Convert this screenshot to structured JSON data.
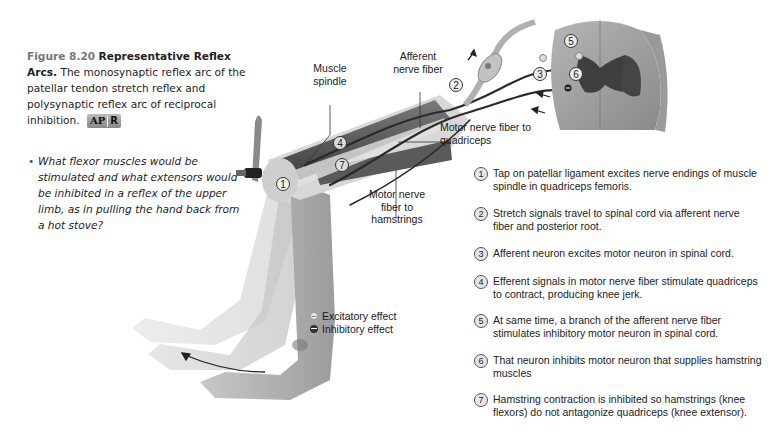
{
  "caption": {
    "figure_number": "Figure 8.20",
    "title": "Representative Reflex Arcs.",
    "body": "The monosynaptic reflex arc of the patellar tendon stretch reflex and polysynaptic reflex arc of reciprocal inhibition.",
    "badge_left": "AP",
    "badge_right": "R"
  },
  "question": {
    "bullet": "•",
    "text": "What flexor muscles would be stimulated and what extensors would be inhibited in a reflex of the upper limb, as in pulling the hand back from a hot stove?"
  },
  "labels": {
    "muscle_spindle": "Muscle spindle",
    "afferent_nerve_fiber": "Afferent nerve fiber",
    "motor_nerve_quadriceps": "Motor nerve fiber to quadriceps",
    "motor_nerve_hamstrings": "Motor nerve fiber to hamstrings"
  },
  "diagram_markers": [
    "1",
    "2",
    "3",
    "4",
    "5",
    "6",
    "7"
  ],
  "legend": {
    "excitatory": "Excitatory effect",
    "inhibitory": "Inhibitory effect"
  },
  "steps": [
    {
      "num": "1",
      "text": "Tap on patellar ligament excites nerve endings of muscle spindle in quadriceps femoris."
    },
    {
      "num": "2",
      "text": "Stretch signals travel to spinal cord via afferent nerve fiber and posterior root."
    },
    {
      "num": "3",
      "text": "Afferent neuron excites motor neuron in spinal cord."
    },
    {
      "num": "4",
      "text": "Efferent signals in motor nerve fiber stimulate quadriceps to contract, producing knee jerk."
    },
    {
      "num": "5",
      "text": "At same time, a branch of the afferent nerve fiber stimulates inhibitory motor neuron in spinal cord."
    },
    {
      "num": "6",
      "text": "That neuron inhibits motor neuron that supplies hamstring muscles"
    },
    {
      "num": "7",
      "text": "Hamstring contraction is inhibited so hamstrings (knee flexors) do not antagonize quadriceps (knee extensor)."
    }
  ]
}
